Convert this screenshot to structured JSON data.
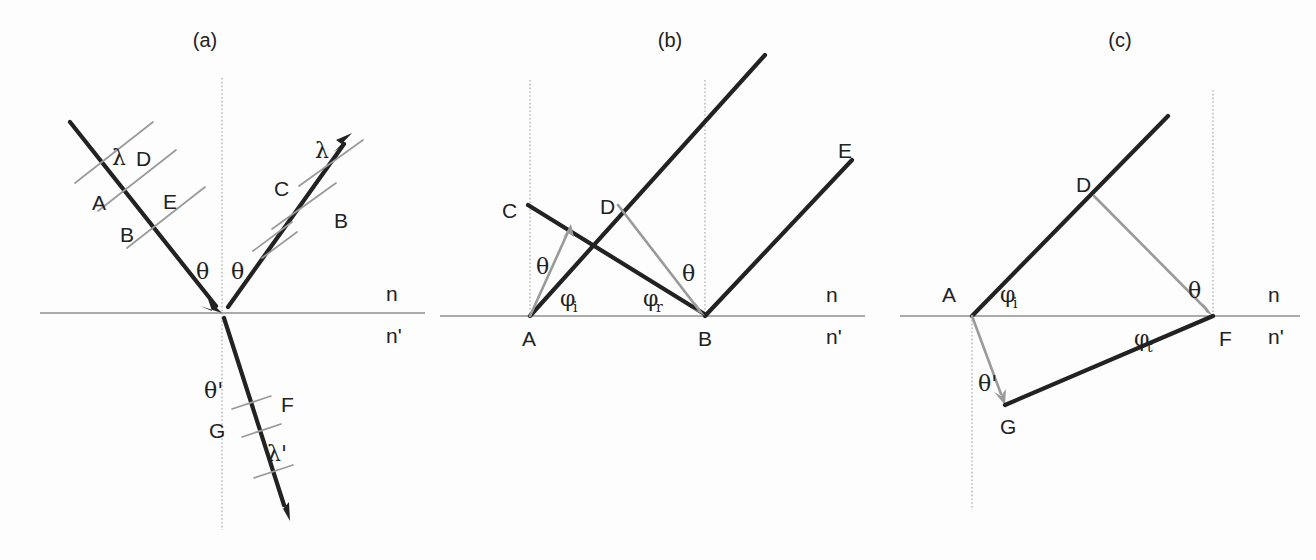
{
  "figure": {
    "background_color": "#fdfdfd",
    "ray_color": "#222222",
    "construction_color": "#9a9a9a",
    "interface_color": "#8f8f8f"
  },
  "panels": [
    {
      "id": "a",
      "label": "(a)",
      "media_upper": "n",
      "media_lower": "n'",
      "angles": [
        {
          "key": "theta_incident",
          "text": "θ"
        },
        {
          "key": "theta_reflected",
          "text": "θ"
        },
        {
          "key": "theta_refracted",
          "text": "θ'"
        }
      ],
      "wavelengths": [
        {
          "key": "lambda_incident",
          "text": "λ"
        },
        {
          "key": "lambda_reflected",
          "text": "λ"
        },
        {
          "key": "lambda_refracted",
          "text": "λ'"
        }
      ],
      "points": [
        {
          "key": "a_incident_A",
          "text": "A"
        },
        {
          "key": "a_incident_D",
          "text": "D"
        },
        {
          "key": "a_incident_B",
          "text": "B"
        },
        {
          "key": "a_incident_E",
          "text": "E"
        },
        {
          "key": "a_reflected_C",
          "text": "C"
        },
        {
          "key": "a_reflected_B",
          "text": "B"
        },
        {
          "key": "a_refracted_G",
          "text": "G"
        },
        {
          "key": "a_refracted_F",
          "text": "F"
        }
      ]
    },
    {
      "id": "b",
      "label": "(b)",
      "media_upper": "n",
      "media_lower": "n'",
      "angles": [
        {
          "key": "b_theta_left",
          "text": "θ"
        },
        {
          "key": "b_theta_right",
          "text": "θ"
        },
        {
          "key": "b_phi_i_base",
          "text": "φ",
          "subscript": "i"
        },
        {
          "key": "b_phi_r_base",
          "text": "φ",
          "subscript": "r"
        }
      ],
      "points": [
        {
          "key": "b_A",
          "text": "A"
        },
        {
          "key": "b_B",
          "text": "B"
        },
        {
          "key": "b_C",
          "text": "C"
        },
        {
          "key": "b_D",
          "text": "D"
        },
        {
          "key": "b_E",
          "text": "E"
        }
      ]
    },
    {
      "id": "c",
      "label": "(c)",
      "media_upper": "n",
      "media_lower": "n'",
      "angles": [
        {
          "key": "c_theta",
          "text": "θ"
        },
        {
          "key": "c_theta_prime",
          "text": "θ'"
        },
        {
          "key": "c_phi_i_base",
          "text": "φ",
          "subscript": "i"
        },
        {
          "key": "c_phi_t_base",
          "text": "φ",
          "subscript": "t"
        }
      ],
      "points": [
        {
          "key": "c_A",
          "text": "A"
        },
        {
          "key": "c_D",
          "text": "D"
        },
        {
          "key": "c_F",
          "text": "F"
        },
        {
          "key": "c_G",
          "text": "G"
        }
      ]
    }
  ],
  "labels": {
    "panel_a": "(a)",
    "panel_b": "(b)",
    "panel_c": "(c)",
    "n": "n",
    "n_prime": "n'",
    "theta": "θ",
    "theta_prime": "θ'",
    "lambda": "λ",
    "lambda_prime": "λ'",
    "phi": "φ",
    "sub_i": "i",
    "sub_r": "r",
    "sub_t": "t",
    "A": "A",
    "B": "B",
    "C": "C",
    "D": "D",
    "E": "E",
    "F": "F",
    "G": "G"
  }
}
